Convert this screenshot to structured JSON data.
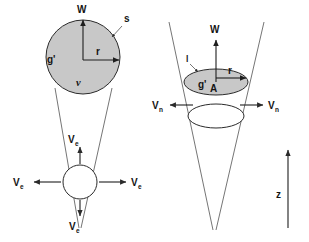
{
  "figure": {
    "background_color": "#ffffff",
    "shape_fill_color": "#c8c8c8",
    "line_color": "#2b2b2b",
    "text_color": "#141414",
    "panels": [
      {
        "id": "left-panel",
        "name": "spherical-thermal-panel",
        "description": "Spherical thermal rising inside a cone with entrainment eddy below",
        "labels": {
          "buoyancy_arrow": "W",
          "surface": "s",
          "reduced_gravity": "g'",
          "radius": "r",
          "volume": "v",
          "entrainment_up": "V",
          "entrainment_up_sub": "e",
          "entrainment_left": "V",
          "entrainment_left_sub": "e",
          "entrainment_right": "V",
          "entrainment_right_sub": "e",
          "entrainment_down": "V",
          "entrainment_down_sub": "e"
        }
      },
      {
        "id": "right-panel",
        "name": "conical-plume-panel",
        "description": "Conical plume element with disk cross-section and normal entrainment velocities",
        "labels": {
          "buoyancy_arrow": "W",
          "element_thickness": "l",
          "reduced_gravity": "g'",
          "radius": "r",
          "area": "A",
          "entrainment_left": "V",
          "entrainment_left_sub": "n",
          "entrainment_right": "V",
          "entrainment_right_sub": "n",
          "axis": "z"
        }
      }
    ]
  }
}
